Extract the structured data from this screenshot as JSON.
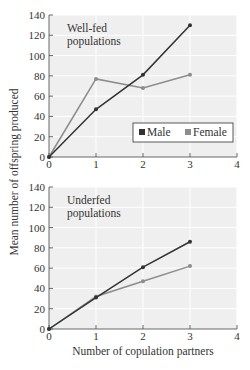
{
  "chart_data": [
    {
      "type": "line",
      "title": "Well-fed populations",
      "title_lines": [
        "Well-fed",
        "populations"
      ],
      "x": [
        0,
        1,
        2,
        3
      ],
      "series": [
        {
          "name": "Male",
          "values": [
            0,
            47,
            81,
            130
          ],
          "color": "#333333"
        },
        {
          "name": "Female",
          "values": [
            0,
            77,
            68,
            81
          ],
          "color": "#8c8c8c"
        }
      ],
      "xlabel": "",
      "ylabel": "Mean number of offspring produced",
      "xlim": [
        0,
        4
      ],
      "ylim": [
        0,
        140
      ],
      "xticks": [
        0,
        1,
        2,
        3,
        4
      ],
      "yticks": [
        0,
        20,
        40,
        60,
        80,
        100,
        120,
        140
      ],
      "grid": true,
      "legend": {
        "position": "lower right",
        "entries": [
          "Male",
          "Female"
        ]
      }
    },
    {
      "type": "line",
      "title": "Underfed populations",
      "title_lines": [
        "Underfed",
        "populations"
      ],
      "x": [
        0,
        1,
        2,
        3
      ],
      "series": [
        {
          "name": "Male",
          "values": [
            0,
            31,
            61,
            86
          ],
          "color": "#333333"
        },
        {
          "name": "Female",
          "values": [
            0,
            32,
            47,
            62
          ],
          "color": "#8c8c8c"
        }
      ],
      "xlabel": "Number of copulation partners",
      "ylabel": "Mean number of offspring produced",
      "xlim": [
        0,
        4
      ],
      "ylim": [
        0,
        140
      ],
      "xticks": [
        0,
        1,
        2,
        3,
        4
      ],
      "yticks": [
        0,
        20,
        40,
        60,
        80,
        100,
        120,
        140
      ],
      "grid": true
    }
  ],
  "labels": {
    "ylabel": "Mean number of offspring produced",
    "xlabel": "Number of copulation partners",
    "legend_male": "Male",
    "legend_female": "Female"
  }
}
